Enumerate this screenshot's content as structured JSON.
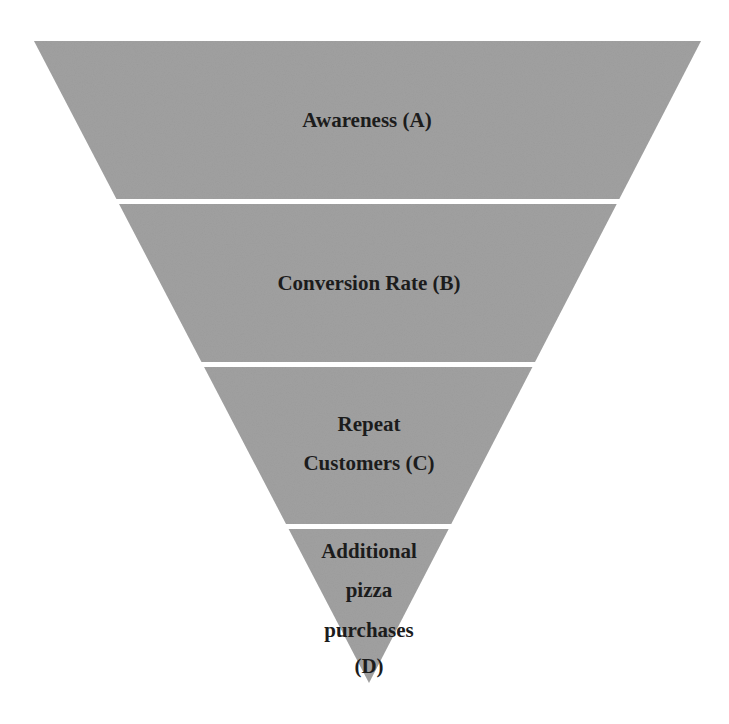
{
  "diagram": {
    "type": "inverted-funnel",
    "colors": {
      "fill": "#9b9b9b",
      "gap": "#ffffff",
      "text": "#1c1c1c",
      "background": "#ffffff"
    },
    "geometry": {
      "top_left": [
        34,
        41
      ],
      "top_right": [
        701,
        41
      ],
      "apex": [
        369,
        683
      ],
      "gap_rows": [
        [
          199,
          204
        ],
        [
          362,
          367
        ],
        [
          524,
          529
        ]
      ]
    },
    "stages": [
      {
        "id": "A",
        "lines": [
          "Awareness (A)"
        ]
      },
      {
        "id": "B",
        "lines": [
          "Conversion Rate (B)"
        ]
      },
      {
        "id": "C",
        "lines": [
          "Repeat",
          "Customers (C)"
        ]
      },
      {
        "id": "D",
        "lines": [
          "Additional",
          "pizza",
          "purchases",
          "(D)"
        ]
      }
    ]
  }
}
